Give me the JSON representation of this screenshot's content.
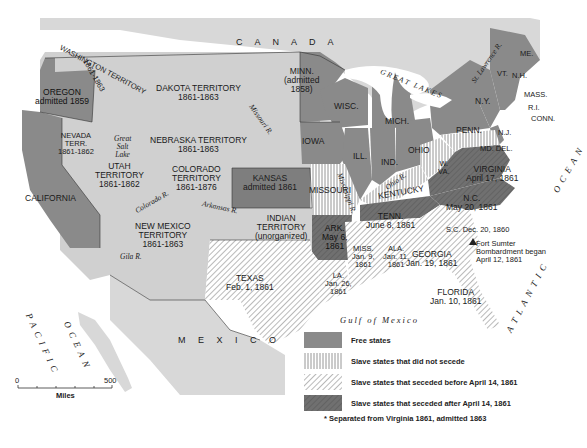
{
  "map": {
    "title": "United States 1861",
    "colors": {
      "free": "#8a8a8a",
      "territory": "#cfcfcf",
      "foreign": "#d8d8d8",
      "late_secession": "#6e6e6e",
      "hatch": "#9a9a9a",
      "water": "#ffffff"
    },
    "regions": {
      "canada": "C A N A D A",
      "mexico": "M E X I C O",
      "pacific": "PACIFIC",
      "ocean_w": "OCEAN",
      "ocean_e": "OCEAN",
      "atlantic": "ATLANTIC",
      "gulf": "Gulf of Mexico",
      "great_lakes": "G R E A T   L A K E S"
    },
    "labels": {
      "washington": "WASHINGTON TERRITORY",
      "washington_years": "1861-1863",
      "oregon": "OREGON\nadmitted 1859",
      "california": "CALIFORNIA",
      "nevada": "NEVADA\nTERR.\n1861-1862",
      "utah": "UTAH\nTERRITORY\n1861-1862",
      "great_salt_lake": "Great\nSalt\nLake",
      "dakota": "DAKOTA TERRITORY\n1861-1863",
      "nebraska": "NEBRASKA TERRITORY\n1861-1863",
      "colorado": "COLORADO\nTERRITORY\n1861-1876",
      "new_mexico": "NEW MEXICO\nTERRITORY\n1861-1863",
      "kansas": "KANSAS\nadmitted 1861",
      "indian": "INDIAN\nTERRITORY\n(unorganized)",
      "texas": "TEXAS\nFeb. 1, 1861",
      "minn": "MINN.\n(admitted\n1858)",
      "wisc": "WISC.",
      "iowa": "IOWA",
      "mich": "MICH.",
      "ill": "ILL.",
      "ind": "IND.",
      "ohio": "OHIO",
      "missouri": "MISSOURI",
      "kentucky": "KENTUCKY",
      "ark": "ARK.\nMay 6,\n1861",
      "tenn": "TENN.\nJune 8, 1861",
      "la": "LA.\nJan. 26,\n1861",
      "miss": "MISS.\nJan. 9,\n1861",
      "ala": "ALA.\nJan. 11,\n1861",
      "georgia": "GEORGIA\nJan. 19, 1861",
      "florida": "FLORIDA\nJan. 10, 1861",
      "sc": "S.C. Dec. 20, 1860",
      "nc": "N.C.\nMay 20, 1861",
      "virginia": "VIRGINIA\nApril 17, 1861",
      "wva": "W.\nVA.",
      "md_del": "MD. DEL.",
      "penn": "PENN.",
      "nj": "N.J.",
      "ny": "N.Y.",
      "vt": "VT.",
      "nh": "N.H.",
      "me": "ME.",
      "mass": "MASS.",
      "ri": "R.I.",
      "conn": "CONN.",
      "fort_sumter": "Fort Sumter\nBombardment began\nApril 12, 1861"
    },
    "rivers": {
      "missouri": "Missouri R.",
      "mississippi": "Mississippi R.",
      "ohio": "Ohio R.",
      "arkansas": "Arkansas R.",
      "colorado": "Colorado R.",
      "gila": "Gila R.",
      "st_lawrence": "St. Lawrence R."
    },
    "legend": [
      {
        "key": "free",
        "label": "Free states"
      },
      {
        "key": "not_seceded",
        "label": "Slave states that did not secede"
      },
      {
        "key": "before",
        "label": "Slave states that seceded before April 14, 1861"
      },
      {
        "key": "after",
        "label": "Slave states that seceded after April 14, 1861"
      }
    ],
    "legend_note": "* Separated from Virginia 1861, admitted 1863",
    "scale": {
      "min": "0",
      "max": "500",
      "unit": "Miles"
    }
  }
}
